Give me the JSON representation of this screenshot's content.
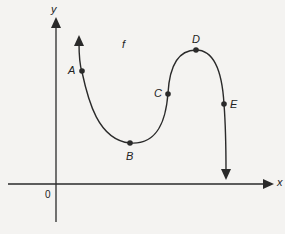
{
  "diagram": {
    "axes": {
      "x_label": "x",
      "y_label": "y",
      "origin_label": "0"
    },
    "function_label": "f",
    "points": [
      {
        "name": "A",
        "desc": "on decreasing part, left"
      },
      {
        "name": "B",
        "desc": "local minimum"
      },
      {
        "name": "C",
        "desc": "on increasing part"
      },
      {
        "name": "D",
        "desc": "local maximum"
      },
      {
        "name": "E",
        "desc": "on decreasing part, right"
      }
    ],
    "colors": {
      "line": "#2a2a2a",
      "background": "#f4f3f1"
    }
  }
}
